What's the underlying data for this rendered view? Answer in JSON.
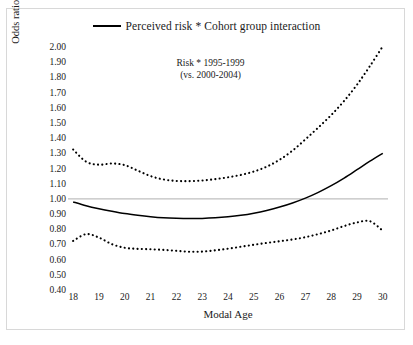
{
  "figure": {
    "legend_label": "Perceived risk * Cohort group interaction",
    "legend_marker": "solid-line-swatch",
    "annotation_line1": "Risk * 1995-1999",
    "annotation_line2": "(vs. 2000-2004)",
    "y_axis_title": "Odds ratio of any past 2 - week binge drinking",
    "x_axis_title": "Modal Age"
  },
  "chart_data": {
    "type": "line",
    "title": "",
    "subtitle": "",
    "annotations": [
      "Risk * 1995-1999",
      "(vs. 2000-2004)"
    ],
    "xlabel": "Modal Age",
    "ylabel": "Odds ratio of any past 2 - week binge drinking",
    "xlim": [
      17.8,
      30.2
    ],
    "ylim": [
      0.4,
      2.0
    ],
    "xticks": [
      18,
      19,
      20,
      21,
      22,
      23,
      24,
      25,
      26,
      27,
      28,
      29,
      30
    ],
    "xtick_labels": [
      "18",
      "19",
      "20",
      "21",
      "22",
      "23",
      "24",
      "25",
      "26",
      "27",
      "28",
      "29",
      "30"
    ],
    "yticks": [
      0.4,
      0.5,
      0.6,
      0.7,
      0.8,
      0.9,
      1.0,
      1.1,
      1.2,
      1.3,
      1.4,
      1.5,
      1.6,
      1.7,
      1.8,
      1.9,
      2.0
    ],
    "ytick_labels": [
      "0.40",
      "0.50",
      "0.60",
      "0.70",
      "0.80",
      "0.90",
      "1.00",
      "1.10",
      "1.20",
      "1.30",
      "1.40",
      "1.50",
      "1.60",
      "1.70",
      "1.80",
      "1.90",
      "2.00"
    ],
    "grid": false,
    "reference_line": {
      "value": 1.0,
      "orientation": "horizontal",
      "color": "#bfbfbf",
      "style": "solid"
    },
    "legend": {
      "position": "top-center",
      "entries": [
        {
          "name": "Perceived risk * Cohort group interaction",
          "style": "solid",
          "color": "#000000"
        }
      ]
    },
    "x": [
      18.0,
      18.5,
      19.0,
      19.5,
      20.0,
      20.5,
      21.0,
      21.5,
      22.0,
      22.5,
      23.0,
      23.5,
      24.0,
      24.5,
      25.0,
      25.5,
      26.0,
      26.5,
      27.0,
      27.5,
      28.0,
      28.5,
      29.0,
      29.5,
      30.0
    ],
    "series": [
      {
        "name": "Odds ratio (point estimate)",
        "style": "solid",
        "color": "#000000",
        "values": [
          0.98,
          0.955,
          0.935,
          0.918,
          0.903,
          0.892,
          0.883,
          0.876,
          0.872,
          0.87,
          0.871,
          0.875,
          0.882,
          0.892,
          0.906,
          0.924,
          0.946,
          0.973,
          1.005,
          1.043,
          1.087,
          1.137,
          1.192,
          1.248,
          1.3
        ]
      },
      {
        "name": "Upper 95% confidence limit",
        "style": "dotted",
        "color": "#000000",
        "values": [
          1.325,
          1.245,
          1.225,
          1.233,
          1.222,
          1.186,
          1.15,
          1.128,
          1.118,
          1.117,
          1.121,
          1.13,
          1.142,
          1.158,
          1.18,
          1.212,
          1.258,
          1.318,
          1.392,
          1.47,
          1.552,
          1.645,
          1.752,
          1.875,
          2.005
        ]
      },
      {
        "name": "Lower 95% confidence limit",
        "style": "dotted",
        "color": "#000000",
        "values": [
          0.723,
          0.768,
          0.745,
          0.702,
          0.678,
          0.671,
          0.668,
          0.664,
          0.658,
          0.652,
          0.653,
          0.661,
          0.672,
          0.685,
          0.698,
          0.71,
          0.721,
          0.733,
          0.748,
          0.768,
          0.792,
          0.821,
          0.845,
          0.853,
          0.79
        ]
      }
    ]
  }
}
